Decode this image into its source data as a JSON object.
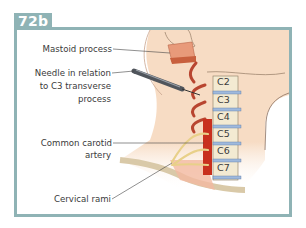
{
  "figure": {
    "tag": "72b",
    "colors": {
      "frame": "#8fb3b5",
      "skin": "#f7dcc4",
      "artery": "#c8301e",
      "nerve": "#e8d089",
      "disc": "#9fb9dc",
      "bone": "#f3ead2"
    }
  },
  "labels": {
    "mastoid": "Mastoid process",
    "needle_1": "Needle in relation",
    "needle_2": "to C3 transverse",
    "needle_3": "process",
    "carotid_1": "Common carotid",
    "carotid_2": "artery",
    "rami": "Cervical rami"
  },
  "vertebrae": [
    "C2",
    "C3",
    "C4",
    "C5",
    "C6",
    "C7"
  ]
}
